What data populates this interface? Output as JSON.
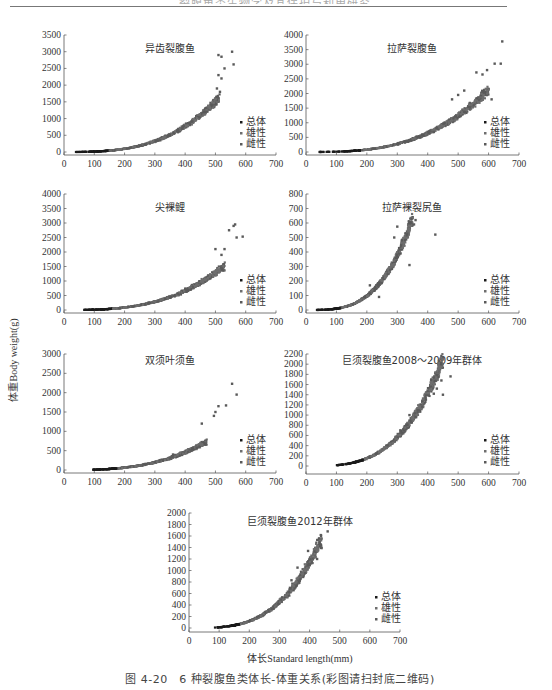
{
  "page": {
    "header_text": "裂腹鱼类生物学及其保护与利用研究",
    "y_axis_label": "体重Body weight(g)",
    "x_axis_label": "体长Standard length(mm)",
    "caption": "图 4-20　6 种裂腹鱼类体长-体重关系(彩图请扫封底二维码)"
  },
  "colors": {
    "total": "#1a1a1a",
    "male": "#6e6e6e",
    "female": "#5a5a5a",
    "axis": "#555555"
  },
  "legend": [
    "总体",
    "雄性",
    "雌性"
  ],
  "chart_data": [
    {
      "id": "c1",
      "type": "scatter",
      "title": "异齿裂腹鱼",
      "xlabel": "体长Standard length(mm)",
      "ylabel": "体重Body weight(g)",
      "xlim": [
        0,
        700
      ],
      "ylim": [
        0,
        3500
      ],
      "xticks": [
        0,
        100,
        200,
        300,
        400,
        500,
        600,
        700
      ],
      "yticks": [
        0,
        500,
        1000,
        1500,
        2000,
        2500,
        3000,
        3500
      ],
      "legend": [
        "总体",
        "雄性",
        "雌性"
      ],
      "legend_position": "lower right",
      "grid": false,
      "curve": {
        "x_min": 30,
        "x_max": 510,
        "a": 1.2e-05,
        "b": 3.0
      },
      "outliers": [
        [
          510,
          2900
        ],
        [
          520,
          2850
        ],
        [
          555,
          3000
        ],
        [
          560,
          2620
        ],
        [
          530,
          2500
        ],
        [
          510,
          2300
        ],
        [
          520,
          2200
        ],
        [
          505,
          1900
        ],
        [
          515,
          1800
        ]
      ]
    },
    {
      "id": "c2",
      "type": "scatter",
      "title": "拉萨裂腹鱼",
      "xlabel": "体长Standard length(mm)",
      "ylabel": "体重Body weight(g)",
      "xlim": [
        0,
        700
      ],
      "ylim": [
        0,
        4000
      ],
      "xticks": [
        0,
        100,
        200,
        300,
        400,
        500,
        600,
        700
      ],
      "yticks": [
        0,
        500,
        1000,
        1500,
        2000,
        2500,
        3000,
        3500,
        4000
      ],
      "legend": [
        "总体",
        "雄性",
        "雌性"
      ],
      "legend_position": "lower right",
      "grid": false,
      "curve": {
        "x_min": 40,
        "x_max": 600,
        "a": 1.2e-05,
        "b": 2.97
      },
      "outliers": [
        [
          645,
          3780
        ],
        [
          620,
          3020
        ],
        [
          640,
          3020
        ],
        [
          610,
          1800
        ],
        [
          560,
          2720
        ],
        [
          595,
          2800
        ],
        [
          580,
          2650
        ],
        [
          500,
          1950
        ],
        [
          520,
          2100
        ],
        [
          480,
          1800
        ]
      ]
    },
    {
      "id": "c3",
      "type": "scatter",
      "title": "尖裸鲤",
      "xlabel": "体长Standard length(mm)",
      "ylabel": "体重Body weight(g)",
      "xlim": [
        0,
        700
      ],
      "ylim": [
        0,
        4000
      ],
      "xticks": [
        0,
        100,
        200,
        300,
        400,
        500,
        600,
        700
      ],
      "yticks": [
        0,
        500,
        1000,
        1500,
        2000,
        2500,
        3000,
        3500,
        4000
      ],
      "legend": [
        "总体",
        "雄性",
        "雌性"
      ],
      "legend_position": "lower right",
      "grid": false,
      "curve": {
        "x_min": 40,
        "x_max": 530,
        "a": 1.4e-05,
        "b": 2.95
      },
      "outliers": [
        [
          545,
          2750
        ],
        [
          560,
          2900
        ],
        [
          565,
          2950
        ],
        [
          570,
          2500
        ],
        [
          590,
          2530
        ],
        [
          530,
          2100
        ],
        [
          500,
          2100
        ],
        [
          520,
          1900
        ]
      ]
    },
    {
      "id": "c4",
      "type": "scatter",
      "title": "拉萨裸裂尻鱼",
      "xlabel": "体长Standard length(mm)",
      "ylabel": "体重Body weight(g)",
      "xlim": [
        0,
        700
      ],
      "ylim": [
        0,
        800
      ],
      "xticks": [
        0,
        100,
        200,
        300,
        400,
        500,
        600,
        700
      ],
      "yticks": [
        0,
        100,
        200,
        300,
        400,
        500,
        600,
        700,
        800
      ],
      "legend": [
        "总体",
        "雄性",
        "雌性"
      ],
      "legend_position": "lower right",
      "grid": false,
      "curve": {
        "x_min": 35,
        "x_max": 350,
        "a": 1.9e-06,
        "b": 3.35
      },
      "outliers": [
        [
          425,
          520
        ],
        [
          360,
          620
        ],
        [
          355,
          590
        ],
        [
          300,
          575
        ],
        [
          290,
          500
        ],
        [
          240,
          90
        ],
        [
          340,
          310
        ],
        [
          210,
          170
        ]
      ]
    },
    {
      "id": "c5",
      "type": "scatter",
      "title": "双须叶须鱼",
      "xlabel": "体长Standard length(mm)",
      "ylabel": "体重Body weight(g)",
      "xlim": [
        0,
        700
      ],
      "ylim": [
        0,
        3000
      ],
      "xticks": [
        0,
        100,
        200,
        300,
        400,
        500,
        600,
        700
      ],
      "yticks": [
        0,
        500,
        1000,
        1500,
        2000,
        2500,
        3000
      ],
      "legend": [
        "总体",
        "雄性",
        "雌性"
      ],
      "legend_position": "lower right",
      "grid": false,
      "curve": {
        "x_min": 75,
        "x_max": 470,
        "a": 1.3e-05,
        "b": 2.9
      },
      "outliers": [
        [
          555,
          2230
        ],
        [
          570,
          1950
        ],
        [
          535,
          1670
        ],
        [
          510,
          1650
        ],
        [
          500,
          1500
        ],
        [
          495,
          1400
        ],
        [
          455,
          1200
        ],
        [
          360,
          400
        ]
      ]
    },
    {
      "id": "c6",
      "type": "scatter",
      "title": "巨须裂腹鱼2008～2009年群体",
      "xlabel": "体长Standard length(mm)",
      "ylabel": "体重Body weight(g)",
      "xlim": [
        0,
        700
      ],
      "ylim": [
        0,
        2200
      ],
      "xticks": [
        0,
        100,
        200,
        300,
        400,
        500,
        600,
        700
      ],
      "yticks": [
        0,
        200,
        400,
        600,
        800,
        1000,
        1200,
        1400,
        1600,
        1800,
        2000,
        2200
      ],
      "legend": [
        "总体",
        "雄性",
        "雌性"
      ],
      "legend_position": "lower right",
      "grid": false,
      "curve": {
        "x_min": 100,
        "x_max": 450,
        "a": 5e-06,
        "b": 3.25
      },
      "outliers": [
        [
          420,
          1740
        ],
        [
          475,
          1760
        ],
        [
          445,
          1680
        ],
        [
          430,
          1520
        ],
        [
          450,
          1400
        ],
        [
          420,
          1420
        ],
        [
          340,
          1000
        ],
        [
          310,
          700
        ]
      ]
    },
    {
      "id": "c7",
      "type": "scatter",
      "title": "巨须裂腹鱼2012年群体",
      "xlabel": "体长Standard length(mm)",
      "ylabel": "体重Body weight(g)",
      "xlim": [
        0,
        700
      ],
      "ylim": [
        0,
        2000
      ],
      "xticks": [
        0,
        100,
        200,
        300,
        400,
        500,
        600,
        700
      ],
      "yticks": [
        0,
        200,
        400,
        600,
        800,
        1000,
        1200,
        1400,
        1600,
        1800,
        2000
      ],
      "legend": [
        "总体",
        "雄性",
        "雌性"
      ],
      "legend_position": "lower right",
      "grid": false,
      "curve": {
        "x_min": 75,
        "x_max": 440,
        "a": 4e-06,
        "b": 3.25
      },
      "outliers": [
        [
          460,
          1680
        ],
        [
          395,
          1340
        ],
        [
          440,
          1390
        ],
        [
          425,
          1200
        ],
        [
          360,
          1050
        ],
        [
          340,
          830
        ],
        [
          400,
          1100
        ]
      ]
    }
  ]
}
